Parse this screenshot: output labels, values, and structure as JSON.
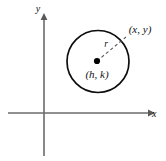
{
  "figure": {
    "name": "circle-standard-form-diagram",
    "background_color": "#ffffff",
    "axes": {
      "x_axis_label": "x",
      "y_axis_label": "y",
      "axis_color": "#6b6b6b",
      "origin": {
        "x": 44,
        "y": 113
      },
      "x_axis": {
        "x_start": 8,
        "x_end": 152,
        "y": 113
      },
      "y_axis": {
        "x": 44,
        "y_start": 14,
        "y_end": 156
      }
    },
    "circle": {
      "center_x": 98,
      "center_y": 61.5,
      "radius": 31,
      "stroke_color": "#0d0d0d",
      "stroke_width": 1.7
    },
    "center_point": {
      "label": "(h, k)",
      "dot_x": 97,
      "dot_y": 61,
      "dot_radius": 3.1,
      "dot_color": "#000000",
      "label_x": 97,
      "label_y": 78
    },
    "circle_point": {
      "label": "(x, y)",
      "label_x": 140,
      "label_y": 33
    },
    "radius_segment": {
      "label": "r",
      "from_x": 97,
      "from_y": 61,
      "to_x": 126,
      "to_y": 37,
      "label_x": 106,
      "label_y": 47,
      "stroke_color": "#555555",
      "dash_pattern": "3.2 2.6"
    }
  }
}
